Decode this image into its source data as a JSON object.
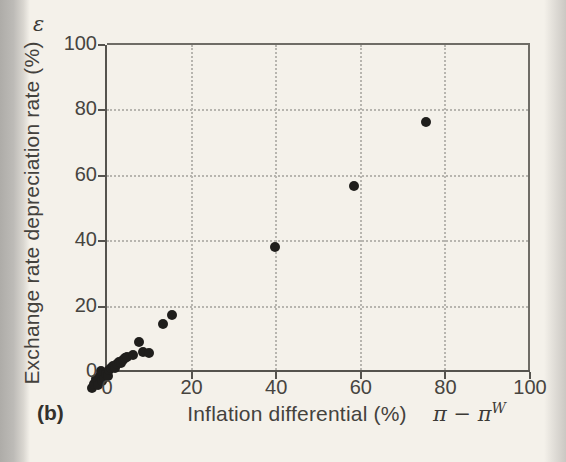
{
  "figure": {
    "panel_label": "(b)"
  },
  "y_axis": {
    "title": "Exchange rate depreciation rate (%)",
    "symbol": "ε",
    "ticks": [
      0,
      20,
      40,
      60,
      80,
      100
    ]
  },
  "x_axis": {
    "title": "Inflation differential (%)",
    "symbol_base": "π − π",
    "symbol_sup": "W",
    "ticks": [
      0,
      20,
      40,
      60,
      80,
      100
    ]
  },
  "colors": {
    "paper": "#f4f1ea",
    "page_edge": "#b3b1ad",
    "axis": "#55534e",
    "grid": "#b7b5af",
    "point": "#1f1e1c",
    "text": "#46443f"
  },
  "chart_data": {
    "type": "scatter",
    "title": "",
    "xlabel": "Inflation differential (%)",
    "ylabel": "Exchange rate depreciation rate (%)",
    "xlim": [
      0,
      100
    ],
    "ylim": [
      0,
      100
    ],
    "grid": true,
    "legend": false,
    "points": [
      [
        -3.6,
        -4.9
      ],
      [
        -3.1,
        -3.6
      ],
      [
        -2.6,
        -2.1
      ],
      [
        -2.1,
        -3.9
      ],
      [
        -1.6,
        -1.1
      ],
      [
        -1.1,
        -2.6
      ],
      [
        -0.6,
        -1.9
      ],
      [
        -1.4,
        0.2
      ],
      [
        -0.3,
        -0.6
      ],
      [
        0.2,
        -1.2
      ],
      [
        0.4,
        0.6
      ],
      [
        0.9,
        1.1
      ],
      [
        1.4,
        1.7
      ],
      [
        1.9,
        1.2
      ],
      [
        2.3,
        2.4
      ],
      [
        2.8,
        3.1
      ],
      [
        3.2,
        2.7
      ],
      [
        3.7,
        3.8
      ],
      [
        4.2,
        4.3
      ],
      [
        4.7,
        4.6
      ],
      [
        6.1,
        5.3
      ],
      [
        7.6,
        9.2
      ],
      [
        8.6,
        6.1
      ],
      [
        9.9,
        5.9
      ],
      [
        13.3,
        14.8
      ],
      [
        15.3,
        17.3
      ],
      [
        39.8,
        38.2
      ],
      [
        58.4,
        56.9
      ],
      [
        75.3,
        76.4
      ]
    ]
  }
}
